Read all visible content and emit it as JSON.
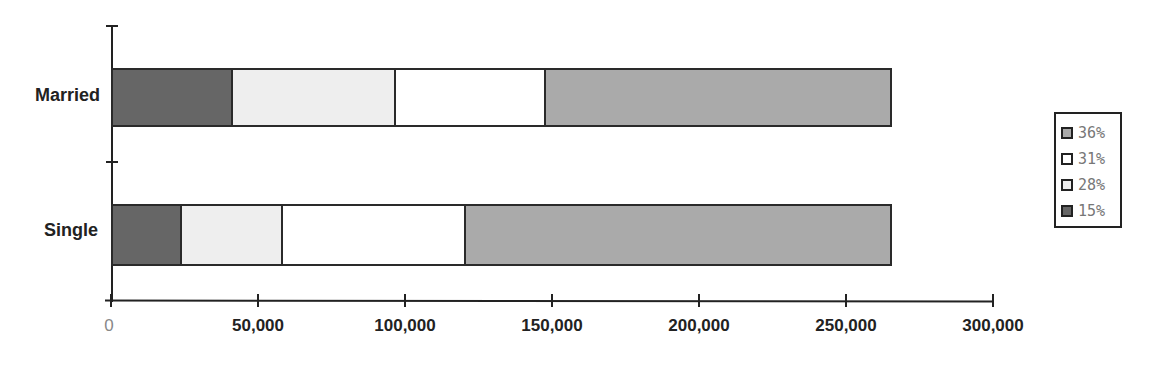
{
  "chart_data": {
    "type": "bar",
    "orientation": "horizontal",
    "stacked": true,
    "title": "",
    "xlabel": "",
    "ylabel": "",
    "categories": [
      "Married",
      "Single"
    ],
    "series": [
      {
        "name": "15%",
        "color": "#666666",
        "values": [
          40800,
          23600
        ]
      },
      {
        "name": "28%",
        "color": "#eeeeee",
        "values": [
          55600,
          34100
        ]
      },
      {
        "name": "31%",
        "color": "#ffffff",
        "values": [
          51000,
          62300
        ]
      },
      {
        "name": "36%",
        "color": "#aaaaaa",
        "values": [
          117600,
          145000
        ]
      }
    ],
    "xlim": [
      0,
      300000
    ],
    "x_ticks": [
      "0",
      "50,000",
      "100,000",
      "150,000",
      "200,000",
      "250,000",
      "300,000"
    ],
    "grid": false,
    "legend": {
      "position": "right",
      "entries": [
        "36%",
        "31%",
        "28%",
        "15%"
      ]
    }
  },
  "legend": {
    "items": [
      {
        "label": "36%",
        "color": "#aaaaaa"
      },
      {
        "label": "31%",
        "color": "#ffffff"
      },
      {
        "label": "28%",
        "color": "#eeeeee"
      },
      {
        "label": "15%",
        "color": "#666666"
      }
    ]
  },
  "categories": {
    "married": "Married",
    "single": "Single"
  },
  "axis": {
    "ticks": [
      "0",
      "50,000",
      "100,000",
      "150,000",
      "200,000",
      "250,000",
      "300,000"
    ]
  }
}
